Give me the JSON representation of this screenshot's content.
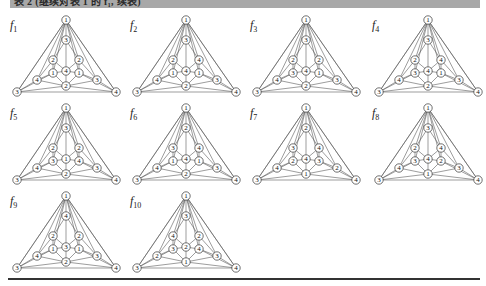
{
  "caption": {
    "text": "表 2    (继续对表 1 的 f₁, 续表)",
    "background": "#a8a8a8"
  },
  "node_order": [
    "top",
    "inner_top",
    "mid_left",
    "mid_right",
    "inner_left",
    "center",
    "inner_right",
    "outer_left",
    "outer_right",
    "bottom_center",
    "bottom_left",
    "bottom_right"
  ],
  "figures": [
    {
      "name": "f",
      "sub": "1",
      "labels": [
        "1",
        "3",
        "2",
        "2",
        "1",
        "4",
        "1",
        "4",
        "3",
        "2",
        "3",
        "4"
      ]
    },
    {
      "name": "f",
      "sub": "2",
      "labels": [
        "1",
        "3",
        "2",
        "4",
        "1",
        "4",
        "1",
        "4",
        "3",
        "2",
        "3",
        "4"
      ]
    },
    {
      "name": "f",
      "sub": "3",
      "labels": [
        "1",
        "3",
        "2",
        "2",
        "3",
        "4",
        "1",
        "4",
        "3",
        "2",
        "3",
        "4"
      ]
    },
    {
      "name": "f",
      "sub": "4",
      "labels": [
        "1",
        "3",
        "2",
        "4",
        "3",
        "4",
        "1",
        "4",
        "3",
        "2",
        "3",
        "4"
      ]
    },
    {
      "name": "f",
      "sub": "5",
      "labels": [
        "1",
        "3",
        "2",
        "2",
        "3",
        "1",
        "4",
        "4",
        "3",
        "2",
        "3",
        "4"
      ]
    },
    {
      "name": "f",
      "sub": "6",
      "labels": [
        "1",
        "2",
        "3",
        "4",
        "1",
        "4",
        "1",
        "4",
        "3",
        "2",
        "3",
        "4"
      ]
    },
    {
      "name": "f",
      "sub": "7",
      "labels": [
        "1",
        "2",
        "3",
        "4",
        "2",
        "4",
        "3",
        "4",
        "2",
        "1",
        "3",
        "4"
      ]
    },
    {
      "name": "f",
      "sub": "8",
      "labels": [
        "1",
        "3",
        "2",
        "4",
        "3",
        "4",
        "2",
        "4",
        "3",
        "1",
        "3",
        "4"
      ]
    },
    {
      "name": "f",
      "sub": "9",
      "labels": [
        "1",
        "4",
        "2",
        "2",
        "1",
        "3",
        "1",
        "4",
        "3",
        "2",
        "3",
        "4"
      ]
    },
    {
      "name": "f",
      "sub": "10",
      "labels": [
        "1",
        "3",
        "4",
        "2",
        "3",
        "2",
        "4",
        "2",
        "3",
        "1",
        "3",
        "4"
      ]
    }
  ]
}
